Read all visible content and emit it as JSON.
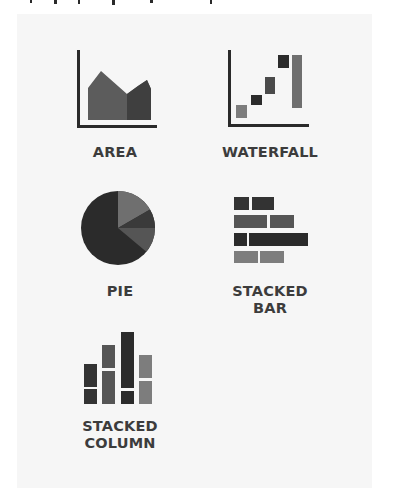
{
  "palette": {
    "background": "#ffffff",
    "panel": "#f6f6f6",
    "label_text": "#3c3c3c",
    "axis": "#2a2a2a",
    "shade_darkest": "#2b2b2b",
    "shade_dark": "#3f3f3f",
    "shade_mid": "#5c5c5c",
    "shade_light": "#7d7d7d"
  },
  "chart_types": [
    {
      "id": "area",
      "label": "AREA",
      "icon": "area-chart-icon"
    },
    {
      "id": "waterfall",
      "label": "WATERFALL",
      "icon": "waterfall-chart-icon"
    },
    {
      "id": "pie",
      "label": "PIE",
      "icon": "pie-chart-icon"
    },
    {
      "id": "stacked-bar",
      "label": "STACKED\nBAR",
      "icon": "stacked-bar-chart-icon"
    },
    {
      "id": "stacked-column",
      "label": "STACKED\nCOLUMN",
      "icon": "stacked-column-chart-icon"
    }
  ]
}
